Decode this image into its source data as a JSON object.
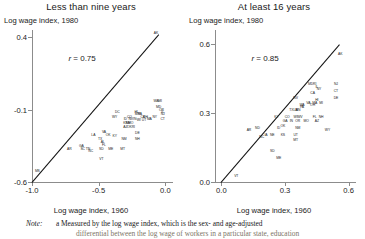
{
  "figure": {
    "note": {
      "label": "Note:",
      "marker": "a",
      "line1": "Measured by the log wage index, which is the sex- and age-adjusted",
      "line2": "differential between the log wage of workers in a particular state, education"
    }
  },
  "chart_data": [
    {
      "type": "scatter",
      "title": "Less than nine years",
      "ylabel": "Log wage index, 1980",
      "xlabel": "Log wage index, 1960",
      "annotation": "r = 0.75",
      "correlation": 0.75,
      "xlim": [
        -1.0,
        0.05
      ],
      "ylim": [
        -0.6,
        0.45
      ],
      "xticks": [
        -1.0,
        -0.5,
        0.0
      ],
      "xticklabels": [
        "-1.0",
        "-0.5",
        "0.0"
      ],
      "yticks": [
        0.4,
        -0.1,
        -0.6
      ],
      "yticklabels": [
        "0.4",
        "-0.1",
        "-0.6"
      ],
      "grid": false,
      "reference_line": {
        "type": "45-degree",
        "from": [
          -1.0,
          -0.6
        ],
        "to": [
          -0.05,
          0.42
        ]
      },
      "points": [
        {
          "label": "AK",
          "x": -0.07,
          "y": 0.42
        },
        {
          "label": "WA",
          "x": -0.07,
          "y": -0.05
        },
        {
          "label": "MI",
          "x": -0.04,
          "y": -0.05
        },
        {
          "label": "MD",
          "x": -0.05,
          "y": -0.09
        },
        {
          "label": "OR",
          "x": -0.03,
          "y": -0.11
        },
        {
          "label": "IL",
          "x": -0.02,
          "y": -0.12
        },
        {
          "label": "NJ",
          "x": -0.02,
          "y": -0.14
        },
        {
          "label": "CT",
          "x": -0.02,
          "y": -0.17
        },
        {
          "label": "NY",
          "x": -0.08,
          "y": -0.16
        },
        {
          "label": "DC",
          "x": -0.36,
          "y": -0.12
        },
        {
          "label": "HI",
          "x": -0.22,
          "y": -0.12
        },
        {
          "label": "WY",
          "x": -0.38,
          "y": -0.16
        },
        {
          "label": "CO",
          "x": -0.27,
          "y": -0.16
        },
        {
          "label": "MN",
          "x": -0.21,
          "y": -0.14
        },
        {
          "label": "PA",
          "x": -0.19,
          "y": -0.14
        },
        {
          "label": "CA",
          "x": -0.17,
          "y": -0.16
        },
        {
          "label": "OH",
          "x": -0.15,
          "y": -0.16
        },
        {
          "label": "MA",
          "x": -0.12,
          "y": -0.17
        },
        {
          "label": "ID",
          "x": -0.3,
          "y": -0.17
        },
        {
          "label": "NV",
          "x": -0.26,
          "y": -0.17
        },
        {
          "label": "IN",
          "x": -0.23,
          "y": -0.17
        },
        {
          "label": "WI",
          "x": -0.2,
          "y": -0.18
        },
        {
          "label": "UT",
          "x": -0.16,
          "y": -0.18
        },
        {
          "label": "KS",
          "x": -0.3,
          "y": -0.2
        },
        {
          "label": "MO",
          "x": -0.26,
          "y": -0.2
        },
        {
          "label": "NE",
          "x": -0.28,
          "y": -0.2
        },
        {
          "label": "AZ",
          "x": -0.3,
          "y": -0.23
        },
        {
          "label": "OK",
          "x": -0.27,
          "y": -0.23
        },
        {
          "label": "RI",
          "x": -0.24,
          "y": -0.23
        },
        {
          "label": "DE",
          "x": -0.21,
          "y": -0.27
        },
        {
          "label": "NH",
          "x": -0.21,
          "y": -0.31
        },
        {
          "label": "LA",
          "x": -0.54,
          "y": -0.28
        },
        {
          "label": "VA",
          "x": -0.46,
          "y": -0.26
        },
        {
          "label": "OK2",
          "x": -0.43,
          "y": -0.28
        },
        {
          "label": "KY",
          "x": -0.38,
          "y": -0.29
        },
        {
          "label": "NM",
          "x": -0.31,
          "y": -0.31
        },
        {
          "label": "TX",
          "x": -0.49,
          "y": -0.31
        },
        {
          "label": "AL",
          "x": -0.47,
          "y": -0.33
        },
        {
          "label": "FL",
          "x": -0.46,
          "y": -0.35
        },
        {
          "label": "AR",
          "x": -0.72,
          "y": -0.38
        },
        {
          "label": "GA",
          "x": -0.63,
          "y": -0.36
        },
        {
          "label": "SC",
          "x": -0.62,
          "y": -0.38
        },
        {
          "label": "TN",
          "x": -0.58,
          "y": -0.38
        },
        {
          "label": "NC",
          "x": -0.56,
          "y": -0.39
        },
        {
          "label": "SD",
          "x": -0.48,
          "y": -0.38
        },
        {
          "label": "ME",
          "x": -0.41,
          "y": -0.38
        },
        {
          "label": "MT",
          "x": -0.32,
          "y": -0.38
        },
        {
          "label": "VT",
          "x": -0.48,
          "y": -0.45
        },
        {
          "label": "MS",
          "x": -0.96,
          "y": -0.53
        }
      ]
    },
    {
      "type": "scatter",
      "title": "At least 16 years",
      "ylabel": "Log wage index, 1980",
      "xlabel": "Log wage index, 1960",
      "annotation": "r = 0.85",
      "correlation": 0.85,
      "xlim": [
        -0.03,
        0.63
      ],
      "ylim": [
        0.0,
        0.66
      ],
      "xticks": [
        0.0,
        0.3,
        0.6
      ],
      "xticklabels": [
        "0.0",
        "0.3",
        "0.6"
      ],
      "yticks": [
        0.6,
        0.3,
        0.0
      ],
      "yticklabels": [
        "0.6",
        "0.3",
        "0.0"
      ],
      "grid": false,
      "reference_line": {
        "type": "45-degree",
        "from": [
          0.0,
          0.0
        ],
        "to": [
          0.56,
          0.6
        ]
      },
      "points": [
        {
          "label": "AK",
          "x": 0.56,
          "y": 0.55
        },
        {
          "label": "NJ",
          "x": 0.54,
          "y": 0.42
        },
        {
          "label": "CT",
          "x": 0.54,
          "y": 0.39
        },
        {
          "label": "DE",
          "x": 0.54,
          "y": 0.36
        },
        {
          "label": "MD",
          "x": 0.42,
          "y": 0.42
        },
        {
          "label": "RI",
          "x": 0.44,
          "y": 0.42
        },
        {
          "label": "IL",
          "x": 0.45,
          "y": 0.41
        },
        {
          "label": "NY",
          "x": 0.46,
          "y": 0.4
        },
        {
          "label": "CA",
          "x": 0.43,
          "y": 0.38
        },
        {
          "label": "NV",
          "x": 0.35,
          "y": 0.36
        },
        {
          "label": "VA",
          "x": 0.41,
          "y": 0.34
        },
        {
          "label": "MA",
          "x": 0.44,
          "y": 0.34
        },
        {
          "label": "WA",
          "x": 0.38,
          "y": 0.33
        },
        {
          "label": "OH",
          "x": 0.43,
          "y": 0.33
        },
        {
          "label": "HI",
          "x": 0.45,
          "y": 0.35
        },
        {
          "label": "MI",
          "x": 0.47,
          "y": 0.34
        },
        {
          "label": "TX",
          "x": 0.33,
          "y": 0.31
        },
        {
          "label": "MN",
          "x": 0.36,
          "y": 0.31
        },
        {
          "label": "LA",
          "x": 0.35,
          "y": 0.31
        },
        {
          "label": "PA",
          "x": 0.38,
          "y": 0.32
        },
        {
          "label": "KY",
          "x": 0.26,
          "y": 0.28
        },
        {
          "label": "CO",
          "x": 0.31,
          "y": 0.28
        },
        {
          "label": "WI",
          "x": 0.35,
          "y": 0.28
        },
        {
          "label": "WV",
          "x": 0.37,
          "y": 0.28
        },
        {
          "label": "FL",
          "x": 0.44,
          "y": 0.28
        },
        {
          "label": "NH",
          "x": 0.47,
          "y": 0.28
        },
        {
          "label": "AZ",
          "x": 0.45,
          "y": 0.26
        },
        {
          "label": "MO",
          "x": 0.4,
          "y": 0.26
        },
        {
          "label": "IN",
          "x": 0.33,
          "y": 0.26
        },
        {
          "label": "OR",
          "x": 0.36,
          "y": 0.26
        },
        {
          "label": "GA",
          "x": 0.3,
          "y": 0.26
        },
        {
          "label": "OK",
          "x": 0.29,
          "y": 0.24
        },
        {
          "label": "ID",
          "x": 0.27,
          "y": 0.23
        },
        {
          "label": "NM",
          "x": 0.36,
          "y": 0.23
        },
        {
          "label": "AR",
          "x": 0.13,
          "y": 0.22
        },
        {
          "label": "ND",
          "x": 0.17,
          "y": 0.23
        },
        {
          "label": "WY",
          "x": 0.5,
          "y": 0.22
        },
        {
          "label": "IA",
          "x": 0.21,
          "y": 0.2
        },
        {
          "label": "NE",
          "x": 0.24,
          "y": 0.2
        },
        {
          "label": "KS",
          "x": 0.29,
          "y": 0.2
        },
        {
          "label": "UT",
          "x": 0.35,
          "y": 0.2
        },
        {
          "label": "MT",
          "x": 0.35,
          "y": 0.18
        },
        {
          "label": "NC",
          "x": 0.19,
          "y": 0.19
        },
        {
          "label": "SD",
          "x": 0.24,
          "y": 0.13
        },
        {
          "label": "ME",
          "x": 0.27,
          "y": 0.1
        },
        {
          "label": "VT",
          "x": 0.07,
          "y": 0.02
        }
      ]
    }
  ]
}
